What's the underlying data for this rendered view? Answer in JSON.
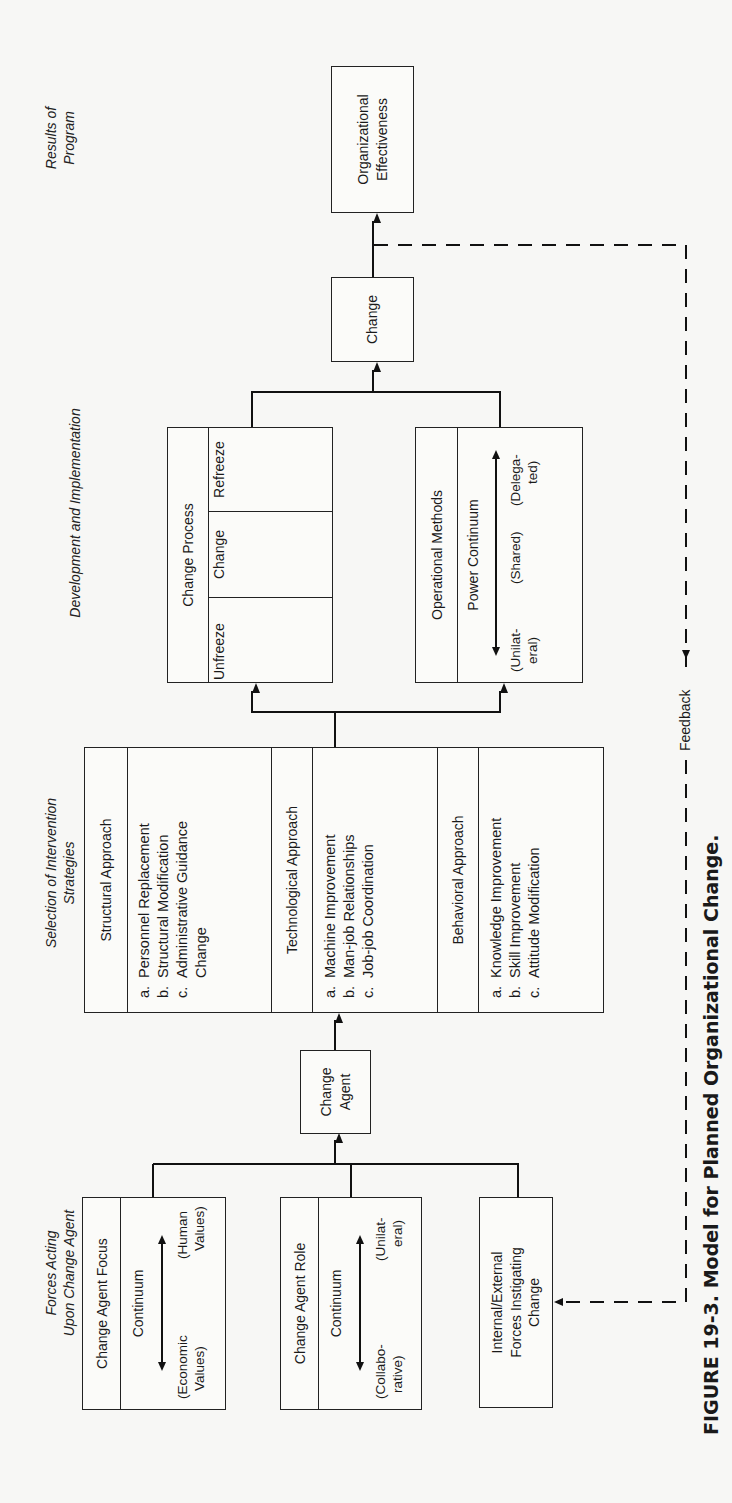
{
  "figure": {
    "caption": "FIGURE 19-3. Model for Planned Organizational Change.",
    "feedback_label": "Feedback"
  },
  "headings": {
    "forces": [
      "Forces Acting",
      "Upon Change Agent"
    ],
    "selection": [
      "Selection of Intervention",
      "Strategies"
    ],
    "development": "Development and Implementation",
    "results": [
      "Results of",
      "Program"
    ]
  },
  "forces": {
    "focus": {
      "title": "Change Agent Focus",
      "continuum": "Continuum",
      "left": [
        "(Economic",
        "Values)"
      ],
      "right": [
        "(Human",
        "Values)"
      ]
    },
    "role": {
      "title": "Change Agent Role",
      "continuum": "Continuum",
      "left": [
        "(Collabo-",
        "rative)"
      ],
      "right": [
        "(Unilat-",
        "eral)"
      ]
    },
    "internal_external": [
      "Internal/External",
      "Forces Instigating",
      "Change"
    ]
  },
  "change_agent": [
    "Change",
    "Agent"
  ],
  "strategies": [
    {
      "title": "Structural Approach",
      "items": [
        {
          "letter": "a.",
          "text": "Personnel Replacement"
        },
        {
          "letter": "b.",
          "text": "Structural Modification"
        },
        {
          "letter": "c.",
          "text": "Administrative Guidance"
        },
        {
          "letter": "",
          "text": "Change"
        }
      ]
    },
    {
      "title": "Technological Approach",
      "items": [
        {
          "letter": "a.",
          "text": "Machine Improvement"
        },
        {
          "letter": "b.",
          "text": "Man-job Relationships"
        },
        {
          "letter": "c.",
          "text": "Job-job Coordination"
        }
      ]
    },
    {
      "title": "Behavioral Approach",
      "items": [
        {
          "letter": "a.",
          "text": "Knowledge Improvement"
        },
        {
          "letter": "b.",
          "text": "Skill Improvement"
        },
        {
          "letter": "c.",
          "text": "Attitude Modification"
        }
      ]
    }
  ],
  "development": {
    "change_process": {
      "title": "Change Process",
      "stages": [
        "Unfreeze",
        "Change",
        "Refreeze"
      ]
    },
    "operational_methods": {
      "title": "Operational Methods",
      "continuum": "Power Continuum",
      "points": [
        [
          "(Unilat-",
          "eral)"
        ],
        [
          "(Shared)"
        ],
        [
          "(Delega-",
          "ted)"
        ]
      ]
    }
  },
  "change_box": "Change",
  "results": [
    "Organizational",
    "Effectiveness"
  ]
}
